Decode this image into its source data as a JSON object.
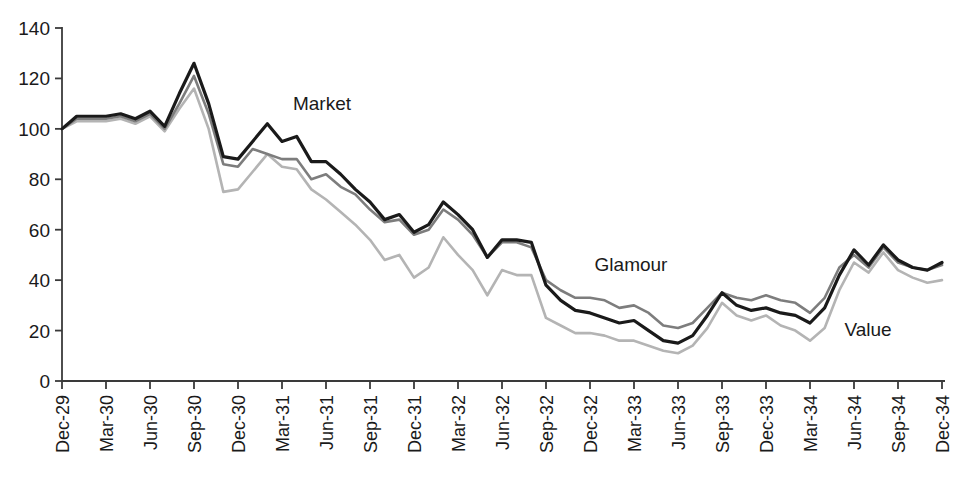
{
  "chart_data": {
    "type": "line",
    "title": "",
    "subtitle": "",
    "xlabel": "",
    "ylabel": "",
    "ylim": [
      0,
      140
    ],
    "ytick_values": [
      0,
      20,
      40,
      60,
      80,
      100,
      120,
      140
    ],
    "ytick_labels": [
      "0",
      "20",
      "40",
      "60",
      "80",
      "100",
      "120",
      "140"
    ],
    "grid": false,
    "legend_position": "inline-annotations",
    "annotations": [
      {
        "text": "Market",
        "series": "Market",
        "x_px": 322,
        "y_px": 110
      },
      {
        "text": "Glamour",
        "series": "Glamour",
        "x_px": 631,
        "y_px": 271
      },
      {
        "text": "Value",
        "series": "Value",
        "x_px": 868,
        "y_px": 336
      }
    ],
    "x_tick_labels": [
      "Dec-29",
      "Mar-30",
      "Jun-30",
      "Sep-30",
      "Dec-30",
      "Mar-31",
      "Jun-31",
      "Sep-31",
      "Dec-31",
      "Mar-32",
      "Jun-32",
      "Sep-32",
      "Dec-32",
      "Mar-33",
      "Jun-33",
      "Sep-33",
      "Dec-33",
      "Mar-34",
      "Jun-34",
      "Sep-34",
      "Dec-34"
    ],
    "x": [
      "Dec-29",
      "Jan-30",
      "Feb-30",
      "Mar-30",
      "Apr-30",
      "May-30",
      "Jun-30",
      "Jul-30",
      "Aug-30",
      "Sep-30",
      "Oct-30",
      "Nov-30",
      "Dec-30",
      "Jan-31",
      "Feb-31",
      "Mar-31",
      "Apr-31",
      "May-31",
      "Jun-31",
      "Jul-31",
      "Aug-31",
      "Sep-31",
      "Oct-31",
      "Nov-31",
      "Dec-31",
      "Jan-32",
      "Feb-32",
      "Mar-32",
      "Apr-32",
      "May-32",
      "Jun-32",
      "Jul-32",
      "Aug-32",
      "Sep-32",
      "Oct-32",
      "Nov-32",
      "Dec-32",
      "Jan-33",
      "Feb-33",
      "Mar-33",
      "Apr-33",
      "May-33",
      "Jun-33",
      "Jul-33",
      "Aug-33",
      "Sep-33",
      "Oct-33",
      "Nov-33",
      "Dec-33",
      "Jan-34",
      "Feb-34",
      "Mar-34",
      "Apr-34",
      "May-34",
      "Jun-34",
      "Jul-34",
      "Aug-34",
      "Sep-34",
      "Oct-34",
      "Nov-34",
      "Dec-34"
    ],
    "series": [
      {
        "name": "Market",
        "color": "#1a1a1a",
        "width": 3.2,
        "values": [
          100,
          105,
          105,
          105,
          106,
          104,
          107,
          101,
          114,
          126,
          110,
          89,
          88,
          95,
          102,
          95,
          97,
          87,
          87,
          82,
          76,
          71,
          64,
          66,
          59,
          62,
          71,
          66,
          60,
          49,
          56,
          56,
          55,
          38,
          32,
          28,
          27,
          25,
          23,
          24,
          20,
          16,
          15,
          18,
          26,
          35,
          30,
          28,
          29,
          27,
          26,
          23,
          29,
          42,
          52,
          46,
          54,
          48,
          45,
          44,
          47
        ]
      },
      {
        "name": "Glamour",
        "color": "#7d7d7d",
        "width": 2.6,
        "values": [
          100,
          104,
          104,
          104,
          105,
          103,
          106,
          100,
          110,
          121,
          106,
          86,
          85,
          92,
          90,
          88,
          88,
          80,
          82,
          77,
          74,
          68,
          63,
          64,
          58,
          60,
          68,
          64,
          58,
          49,
          55,
          55,
          53,
          40,
          36,
          33,
          33,
          32,
          29,
          30,
          27,
          22,
          21,
          23,
          29,
          35,
          33,
          32,
          34,
          32,
          31,
          27,
          33,
          45,
          50,
          45,
          53,
          47,
          45,
          44,
          46
        ]
      },
      {
        "name": "Value",
        "color": "#b4b4b4",
        "width": 2.6,
        "values": [
          100,
          103,
          103,
          103,
          104,
          102,
          105,
          99,
          108,
          116,
          100,
          75,
          76,
          83,
          90,
          85,
          84,
          76,
          72,
          67,
          62,
          56,
          48,
          50,
          41,
          45,
          57,
          50,
          44,
          34,
          44,
          42,
          42,
          25,
          22,
          19,
          19,
          18,
          16,
          16,
          14,
          12,
          11,
          14,
          21,
          31,
          26,
          24,
          26,
          22,
          20,
          16,
          21,
          36,
          47,
          43,
          51,
          44,
          41,
          39,
          40
        ]
      }
    ]
  }
}
